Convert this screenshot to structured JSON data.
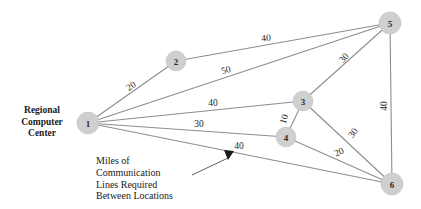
{
  "figure": {
    "type": "network-diagram",
    "background_color": "#ffffff",
    "node_fill_color": "#cfcfcf",
    "edge_color": "#8d8d8d",
    "text_color": "#1a1a1a"
  },
  "annotations": {
    "regional_center": {
      "line1": "Regional",
      "line2": "Computer",
      "line3": "Center"
    },
    "caption": {
      "line1": "Miles of",
      "line2": "Communication",
      "line3": "Lines Required",
      "line4": "Between Locations"
    }
  },
  "chart_data": {
    "type": "diagram",
    "title": "",
    "xlabel": "",
    "ylabel": "",
    "nodes": [
      {
        "id": "1",
        "label": "1",
        "x": 88,
        "y": 123,
        "r": 11
      },
      {
        "id": "2",
        "label": "2",
        "x": 176,
        "y": 61,
        "r": 10
      },
      {
        "id": "3",
        "label": "3",
        "x": 303,
        "y": 101,
        "r": 10
      },
      {
        "id": "4",
        "label": "4",
        "x": 286,
        "y": 137,
        "r": 10
      },
      {
        "id": "5",
        "label": "5",
        "x": 390,
        "y": 23,
        "r": 11
      },
      {
        "id": "6",
        "label": "6",
        "x": 392,
        "y": 184,
        "r": 11
      }
    ],
    "edges": [
      {
        "from": "1",
        "to": "2",
        "weight": "20",
        "label_x": 131,
        "label_y": 86,
        "label_rotation": -35
      },
      {
        "from": "2",
        "to": "5",
        "weight": "40",
        "label_x": 266,
        "label_y": 38,
        "label_rotation": -8
      },
      {
        "from": "1",
        "to": "5",
        "weight": "50",
        "label_x": 226,
        "label_y": 70,
        "label_rotation": -16
      },
      {
        "from": "3",
        "to": "5",
        "weight": "30",
        "label_x": 344,
        "label_y": 58,
        "label_rotation": -50
      },
      {
        "from": "5",
        "to": "6",
        "weight": "40",
        "label_x": 384,
        "label_y": 106,
        "label_rotation": -90
      },
      {
        "from": "1",
        "to": "3",
        "weight": "40",
        "label_x": 213,
        "label_y": 103,
        "label_rotation": 0
      },
      {
        "from": "1",
        "to": "4",
        "weight": "30",
        "label_x": 199,
        "label_y": 124,
        "label_rotation": 0
      },
      {
        "from": "3",
        "to": "4",
        "weight": "10",
        "label_x": 284,
        "label_y": 119,
        "label_rotation": -72
      },
      {
        "from": "3",
        "to": "6",
        "weight": "30",
        "label_x": 353,
        "label_y": 133,
        "label_rotation": -55
      },
      {
        "from": "4",
        "to": "6",
        "weight": "20",
        "label_x": 339,
        "label_y": 152,
        "label_rotation": -25
      },
      {
        "from": "1",
        "to": "6",
        "weight": "40",
        "label_x": 239,
        "label_y": 146,
        "label_rotation": 0
      }
    ],
    "units": "miles"
  }
}
